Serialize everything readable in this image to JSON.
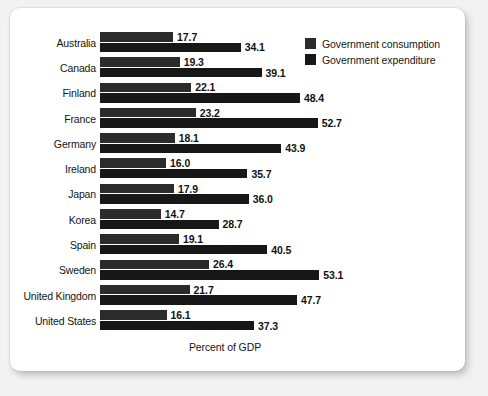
{
  "figure": {
    "axis_title": "Percent of GDP",
    "legend": [
      {
        "label": "Government consumption",
        "color": "#2b2b2b",
        "swatch_name": "legend-swatch-consumption"
      },
      {
        "label": "Government expenditure",
        "color": "#171717",
        "swatch_name": "legend-swatch-expenditure"
      }
    ]
  },
  "chart_data": {
    "type": "bar",
    "orientation": "horizontal",
    "title": "",
    "subtitle": "",
    "xlabel": "Percent of GDP",
    "ylabel": "",
    "xlim": [
      0,
      53.1
    ],
    "grid": false,
    "legend_position": "top-right",
    "categories": [
      "Australia",
      "Canada",
      "Finland",
      "France",
      "Germany",
      "Ireland",
      "Japan",
      "Korea",
      "Spain",
      "Sweden",
      "United Kingdom",
      "United States"
    ],
    "series": [
      {
        "name": "Government consumption",
        "color": "#2b2b2b",
        "values": [
          17.7,
          19.3,
          22.1,
          23.2,
          18.1,
          16.0,
          17.9,
          14.7,
          19.1,
          26.4,
          21.7,
          16.1
        ],
        "labels": [
          "17.7",
          "19.3",
          "22.1",
          "23.2",
          "18.1",
          "16.0",
          "17.9",
          "14.7",
          "19.1",
          "26.4",
          "21.7",
          "16.1"
        ]
      },
      {
        "name": "Government expenditure",
        "color": "#171717",
        "values": [
          34.1,
          39.1,
          48.4,
          52.7,
          43.9,
          35.7,
          36.0,
          28.7,
          40.5,
          53.1,
          47.7,
          37.3
        ],
        "labels": [
          "34.1",
          "39.1",
          "48.4",
          "52.7",
          "43.9",
          "35.7",
          "36.0",
          "28.7",
          "40.5",
          "53.1",
          "47.7",
          "37.3"
        ]
      }
    ]
  }
}
